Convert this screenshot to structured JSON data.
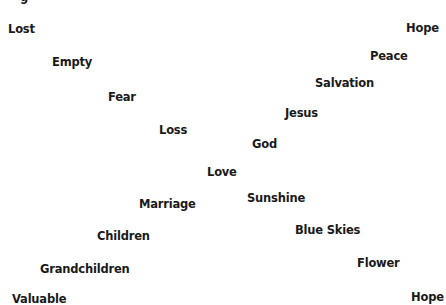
{
  "diagram": {
    "partial_top_glyph": "g",
    "words": [
      {
        "id": "lost",
        "text": "Lost",
        "x": 8,
        "y": 22
      },
      {
        "id": "empty",
        "text": "Empty",
        "x": 52,
        "y": 55
      },
      {
        "id": "fear",
        "text": "Fear",
        "x": 108,
        "y": 90
      },
      {
        "id": "loss",
        "text": "Loss",
        "x": 159,
        "y": 123
      },
      {
        "id": "love",
        "text": "Love",
        "x": 207,
        "y": 165
      },
      {
        "id": "god",
        "text": "God",
        "x": 252,
        "y": 137
      },
      {
        "id": "jesus",
        "text": "Jesus",
        "x": 285,
        "y": 106
      },
      {
        "id": "salvation",
        "text": "Salvation",
        "x": 315,
        "y": 76
      },
      {
        "id": "peace",
        "text": "Peace",
        "x": 370,
        "y": 49
      },
      {
        "id": "hope-top",
        "text": "Hope",
        "x": 406,
        "y": 21
      },
      {
        "id": "valuable",
        "text": "Valuable",
        "x": 12,
        "y": 292
      },
      {
        "id": "grandchildren",
        "text": "Grandchildren",
        "x": 40,
        "y": 262
      },
      {
        "id": "children",
        "text": "Children",
        "x": 97,
        "y": 229
      },
      {
        "id": "marriage",
        "text": "Marriage",
        "x": 139,
        "y": 197
      },
      {
        "id": "sunshine",
        "text": "Sunshine",
        "x": 247,
        "y": 191
      },
      {
        "id": "blue-skies",
        "text": "Blue Skies",
        "x": 295,
        "y": 223
      },
      {
        "id": "flower",
        "text": "Flower",
        "x": 357,
        "y": 256
      },
      {
        "id": "hope-bottom",
        "text": "Hope",
        "x": 411,
        "y": 290
      }
    ]
  }
}
